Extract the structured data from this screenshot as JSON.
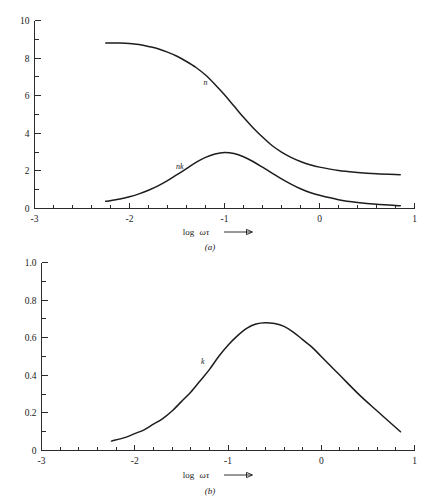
{
  "figure": {
    "panels": [
      {
        "id": "a",
        "caption": "(a)",
        "xlabel_text": "log",
        "xlabel_symbol": "ωτ",
        "xticklabels": [
          "-3",
          "-2",
          "-1",
          "0",
          "1"
        ],
        "yticklabels": [
          "0",
          "2",
          "4",
          "6",
          "8",
          "10"
        ],
        "curve_labels": [
          "n",
          "nk"
        ]
      },
      {
        "id": "b",
        "caption": "(b)",
        "xlabel_text": "log",
        "xlabel_symbol": "ωτ",
        "xticklabels": [
          "-3",
          "-2",
          "-1",
          "0",
          "1"
        ],
        "yticklabels": [
          "0",
          "0.2",
          "0.4",
          "0.6",
          "0.8",
          "1.0"
        ],
        "curve_labels": [
          "k"
        ]
      }
    ]
  },
  "chart_data": [
    {
      "type": "line",
      "title": "",
      "subtitle": "(a)",
      "xlabel": "log ωτ",
      "ylabel": "",
      "xlim": [
        -3,
        1
      ],
      "ylim": [
        0,
        10
      ],
      "xticks": [
        -3,
        -2,
        -1,
        0,
        1
      ],
      "xtick_labels": [
        "-3",
        "-2",
        "-1",
        "0",
        "1"
      ],
      "xminor_step": 0.2,
      "yticks": [
        0,
        2,
        4,
        6,
        8,
        10
      ],
      "ytick_labels": [
        "0",
        "2",
        "4",
        "6",
        "8",
        "10"
      ],
      "yminor_step": 1,
      "grid": false,
      "legend": "inline-annotations",
      "series": [
        {
          "name": "n",
          "label_position": {
            "x": -1.2,
            "y": 6.55
          },
          "x": [
            -2.25,
            -2.1,
            -2.0,
            -1.9,
            -1.8,
            -1.7,
            -1.6,
            -1.5,
            -1.4,
            -1.3,
            -1.2,
            -1.1,
            -1.0,
            -0.9,
            -0.8,
            -0.7,
            -0.6,
            -0.5,
            -0.4,
            -0.3,
            -0.2,
            -0.1,
            0.0,
            0.2,
            0.4,
            0.6,
            0.85
          ],
          "y": [
            8.8,
            8.8,
            8.78,
            8.72,
            8.62,
            8.5,
            8.32,
            8.1,
            7.82,
            7.5,
            7.1,
            6.6,
            6.05,
            5.45,
            4.85,
            4.3,
            3.8,
            3.35,
            3.0,
            2.72,
            2.5,
            2.33,
            2.2,
            2.02,
            1.92,
            1.85,
            1.8
          ]
        },
        {
          "name": "nk",
          "label_position": {
            "x": -1.47,
            "y": 2.1
          },
          "x": [
            -2.25,
            -2.1,
            -2.0,
            -1.9,
            -1.8,
            -1.7,
            -1.6,
            -1.5,
            -1.4,
            -1.3,
            -1.2,
            -1.1,
            -1.0,
            -0.9,
            -0.8,
            -0.7,
            -0.6,
            -0.5,
            -0.4,
            -0.3,
            -0.2,
            -0.1,
            0.0,
            0.2,
            0.4,
            0.6,
            0.85
          ],
          "y": [
            0.38,
            0.5,
            0.62,
            0.78,
            0.97,
            1.2,
            1.48,
            1.8,
            2.12,
            2.45,
            2.72,
            2.9,
            2.98,
            2.92,
            2.75,
            2.5,
            2.2,
            1.88,
            1.58,
            1.3,
            1.05,
            0.85,
            0.7,
            0.47,
            0.32,
            0.22,
            0.15
          ]
        }
      ]
    },
    {
      "type": "line",
      "title": "",
      "subtitle": "(b)",
      "xlabel": "log ωτ",
      "ylabel": "",
      "xlim": [
        -3,
        1
      ],
      "ylim": [
        0,
        1.0
      ],
      "xticks": [
        -3,
        -2,
        -1,
        0,
        1
      ],
      "xtick_labels": [
        "-3",
        "-2",
        "-1",
        "0",
        "1"
      ],
      "xminor_step": 0.2,
      "yticks": [
        0,
        0.2,
        0.4,
        0.6,
        0.8,
        1.0
      ],
      "ytick_labels": [
        "0",
        "0.2",
        "0.4",
        "0.6",
        "0.8",
        "1.0"
      ],
      "yminor_step": 0.1,
      "grid": false,
      "legend": "inline-annotations",
      "series": [
        {
          "name": "k",
          "label_position": {
            "x": -1.27,
            "y": 0.46
          },
          "x": [
            -2.25,
            -2.1,
            -2.0,
            -1.9,
            -1.8,
            -1.7,
            -1.6,
            -1.5,
            -1.4,
            -1.3,
            -1.2,
            -1.1,
            -1.0,
            -0.9,
            -0.8,
            -0.7,
            -0.6,
            -0.5,
            -0.4,
            -0.3,
            -0.2,
            -0.1,
            0.0,
            0.2,
            0.4,
            0.6,
            0.85
          ],
          "y": [
            0.05,
            0.07,
            0.09,
            0.11,
            0.14,
            0.17,
            0.21,
            0.26,
            0.31,
            0.37,
            0.43,
            0.5,
            0.56,
            0.61,
            0.65,
            0.673,
            0.68,
            0.675,
            0.66,
            0.63,
            0.59,
            0.55,
            0.5,
            0.4,
            0.3,
            0.21,
            0.1
          ]
        }
      ]
    }
  ]
}
